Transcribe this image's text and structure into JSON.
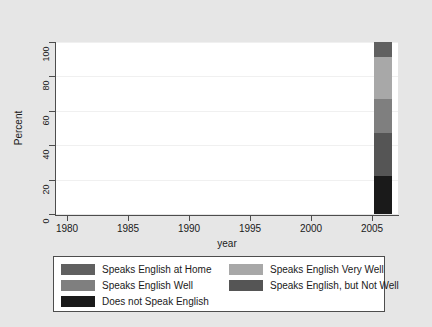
{
  "chart_data": {
    "type": "bar",
    "subtype": "stacked-bar-100-percent",
    "title": "",
    "xlabel": "year",
    "ylabel": "Percent",
    "xlim": [
      1979.0,
      2007.0
    ],
    "ylim": [
      0,
      100
    ],
    "grid": true,
    "x_ticks": [
      "1980",
      "1985",
      "1990",
      "1995",
      "2000",
      "2005"
    ],
    "x_tick_values": [
      1980,
      1985,
      1990,
      1995,
      2000,
      2005
    ],
    "y_ticks": [
      "0",
      "20",
      "40",
      "60",
      "80",
      "100"
    ],
    "y_tick_values": [
      0,
      20,
      40,
      60,
      80,
      100
    ],
    "categories": [
      "2005"
    ],
    "x": [
      2005
    ],
    "legend_position": "below-plot",
    "series": [
      {
        "name": "Does not Speak English",
        "color": "#1a1a1a",
        "values": [
          22
        ],
        "stack_from": 0,
        "stack_to": 22
      },
      {
        "name": "Speaks English, but Not Well",
        "color": "#555555",
        "values": [
          25
        ],
        "stack_from": 22,
        "stack_to": 47
      },
      {
        "name": "Speaks English Well",
        "color": "#7f7f7f",
        "values": [
          20
        ],
        "stack_from": 47,
        "stack_to": 67
      },
      {
        "name": "Speaks English Very Well",
        "color": "#a8a8a8",
        "values": [
          24
        ],
        "stack_from": 67,
        "stack_to": 91
      },
      {
        "name": "Speaks English at Home",
        "color": "#606060",
        "values": [
          9
        ],
        "stack_from": 91,
        "stack_to": 100
      }
    ]
  },
  "axes": {
    "y_title": "Percent",
    "x_title": "year",
    "y_tick_labels": [
      "100",
      "80",
      "60",
      "40",
      "20",
      "0"
    ],
    "x_tick_labels": [
      "1980",
      "1985",
      "1990",
      "1995",
      "2000",
      "2005"
    ]
  },
  "legend": {
    "left_column": [
      {
        "label": "Speaks English at Home",
        "color": "#606060"
      },
      {
        "label": "Speaks English Well",
        "color": "#7f7f7f"
      },
      {
        "label": "Does not Speak English",
        "color": "#1a1a1a"
      }
    ],
    "right_column": [
      {
        "label": "Speaks English Very Well",
        "color": "#a8a8a8"
      },
      {
        "label": "Speaks English, but Not Well",
        "color": "#555555"
      }
    ]
  },
  "colors": {
    "figure_background": "#e6e6e6",
    "plot_background": "#ffffff",
    "axis": "#4d4d4d",
    "gridline": "#f0f0f0",
    "text": "#1a1a1a"
  }
}
